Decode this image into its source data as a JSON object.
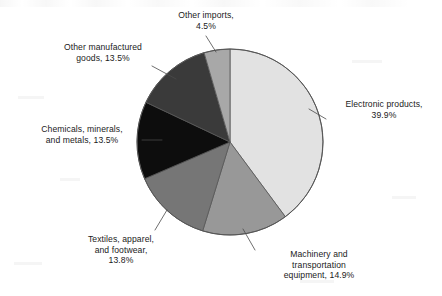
{
  "chart_data": {
    "type": "pie",
    "title": "",
    "subtitle": "",
    "xlabel": "",
    "ylabel": "",
    "legend_position": "none",
    "labels_position": "outside-with-leader-lines",
    "grid": false,
    "units": "percent",
    "total": 100.1,
    "categories": [
      "Electronic products",
      "Machinery and transportation equipment",
      "Textiles, apparel, and footwear",
      "Chemicals, minerals, and metals",
      "Other manufactured goods",
      "Other imports"
    ],
    "values": [
      39.9,
      14.9,
      13.8,
      13.5,
      13.5,
      4.5
    ],
    "slices": [
      {
        "name": "Electronic products",
        "value": 39.9,
        "value_text": "39.9%",
        "label_text": "Electronic products,\n39.9%",
        "color": "#e2e2e2",
        "start_angle": 0,
        "end_angle": 143.64
      },
      {
        "name": "Machinery and transportation equipment",
        "value": 14.9,
        "value_text": "14.9%",
        "label_text": "Machinery and\ntransportation\nequipment, 14.9%",
        "color": "#989898",
        "start_angle": 143.64,
        "end_angle": 197.28
      },
      {
        "name": "Textiles, apparel, and footwear",
        "value": 13.8,
        "value_text": "13.8%",
        "label_text": "Textiles, apparel,\nand footwear,\n13.8%",
        "color": "#767676",
        "start_angle": 197.28,
        "end_angle": 246.96
      },
      {
        "name": "Chemicals, minerals, and metals",
        "value": 13.5,
        "value_text": "13.5%",
        "label_text": "Chemicals, minerals,\nand metals, 13.5%",
        "color": "#0d0d0d",
        "start_angle": 246.96,
        "end_angle": 295.56
      },
      {
        "name": "Other manufactured goods",
        "value": 13.5,
        "value_text": "13.5%",
        "label_text": "Other manufactured\ngoods, 13.5%",
        "color": "#3a3a3a",
        "start_angle": 295.56,
        "end_angle": 344.16
      },
      {
        "name": "Other imports",
        "value": 4.5,
        "value_text": "4.5%",
        "label_text": "Other imports,\n4.5%",
        "color": "#a8a8a8",
        "start_angle": 344.16,
        "end_angle": 360
      }
    ]
  },
  "figure": {
    "background_color": "#ffffff",
    "outline_color": "#555555",
    "leader_line_color": "#4a4a4a",
    "text_color": "#1b1b1b"
  }
}
